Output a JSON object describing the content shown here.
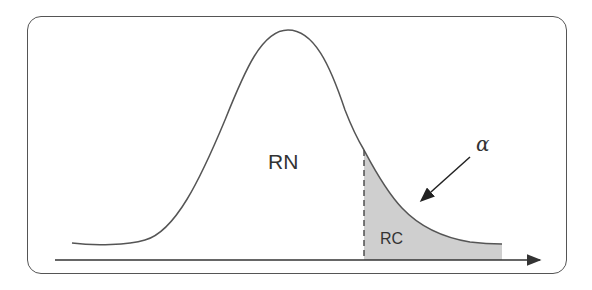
{
  "diagram": {
    "type": "normal-distribution-rejection-region",
    "regions": {
      "acceptance_label": "RN",
      "rejection_label": "RC"
    },
    "significance_label": "α",
    "colors": {
      "stroke": "#555555",
      "shaded_fill": "#cfcfcf",
      "text": "#333333",
      "background": "#ffffff"
    }
  }
}
